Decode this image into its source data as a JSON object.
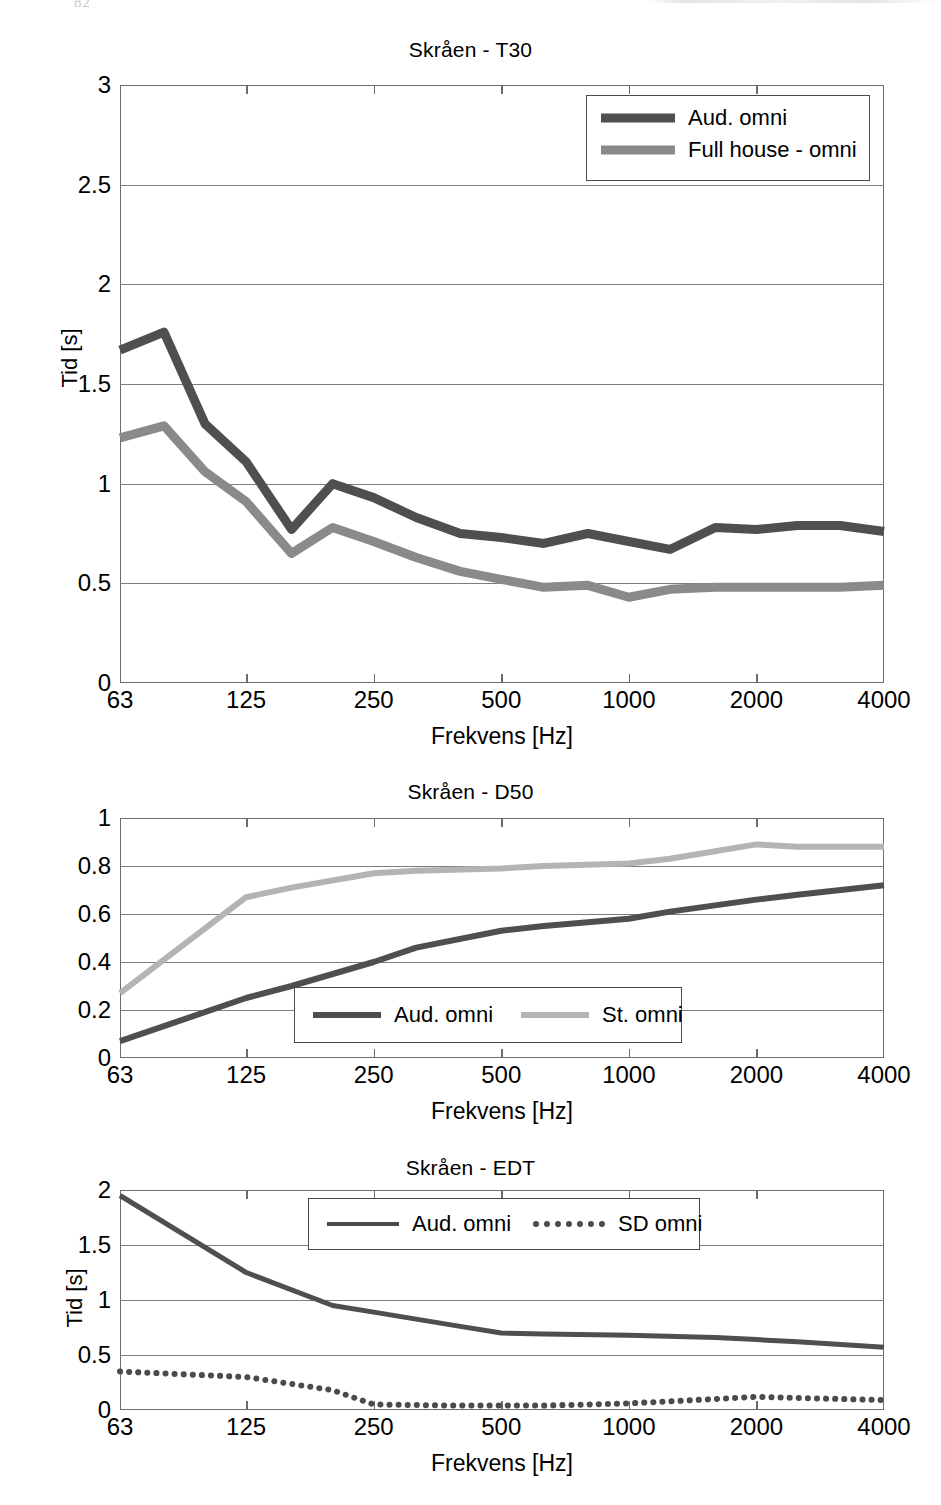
{
  "page": {
    "artifact_number": "82"
  },
  "colors": {
    "dark_series": "#4f4f4f",
    "mid_series": "#8a8a8a",
    "light_series": "#b4b4b4",
    "axis": "#6d6d6d",
    "grid": "#7d7d7d",
    "background": "#ffffff"
  },
  "figures": [
    {
      "id": "t30",
      "title": "Skråen - T30",
      "ylabel": "Tid [s]",
      "xlabel": "Frekvens [Hz]",
      "legend": {
        "position": "top-right",
        "orientation": "vertical",
        "entries": [
          {
            "label": "Aud. omni",
            "color": "#4f4f4f",
            "style": "solid"
          },
          {
            "label": "Full house - omni",
            "color": "#8a8a8a",
            "style": "solid"
          }
        ]
      }
    },
    {
      "id": "d50",
      "title": "Skråen - D50",
      "ylabel": "",
      "xlabel": "Frekvens [Hz]",
      "legend": {
        "position": "bottom-center",
        "orientation": "horizontal",
        "entries": [
          {
            "label": "Aud. omni",
            "color": "#4f4f4f",
            "style": "solid"
          },
          {
            "label": "St. omni",
            "color": "#b4b4b4",
            "style": "solid"
          }
        ]
      }
    },
    {
      "id": "edt",
      "title": "Skråen - EDT",
      "ylabel": "Tid [s]",
      "xlabel": "Frekvens [Hz]",
      "legend": {
        "position": "top-center",
        "orientation": "horizontal",
        "entries": [
          {
            "label": "Aud. omni",
            "color": "#4f4f4f",
            "style": "solid"
          },
          {
            "label": "SD omni",
            "color": "#4b4b4b",
            "style": "dotted"
          }
        ]
      }
    }
  ],
  "chart_data": [
    {
      "type": "line",
      "title": "Skråen - T30",
      "xlabel": "Frekvens [Hz]",
      "ylabel": "Tid [s]",
      "xscale": "log",
      "xlim": [
        63,
        4000
      ],
      "ylim": [
        0,
        3
      ],
      "yticks": [
        0,
        0.5,
        1,
        1.5,
        2,
        2.5,
        3
      ],
      "ytick_labels": [
        "0",
        "0.5",
        "1",
        "1.5",
        "2",
        "2.5",
        "3"
      ],
      "xticks": [
        63,
        125,
        250,
        500,
        1000,
        2000,
        4000
      ],
      "xtick_labels": [
        "63",
        "125",
        "250",
        "500",
        "1000",
        "2000",
        "4000"
      ],
      "grid": true,
      "legend_position": "upper right",
      "x": [
        63,
        80,
        100,
        125,
        160,
        200,
        250,
        315,
        400,
        500,
        630,
        800,
        1000,
        1250,
        1600,
        2000,
        2500,
        3150,
        4000
      ],
      "series": [
        {
          "name": "Aud. omni",
          "color": "#4f4f4f",
          "style": "solid",
          "values": [
            1.67,
            1.76,
            1.3,
            1.11,
            0.77,
            1.0,
            0.93,
            0.83,
            0.75,
            0.73,
            0.7,
            0.75,
            0.71,
            0.67,
            0.78,
            0.77,
            0.79,
            0.79,
            0.76
          ]
        },
        {
          "name": "Full house - omni",
          "color": "#8a8a8a",
          "style": "solid",
          "values": [
            1.23,
            1.29,
            1.06,
            0.91,
            0.65,
            0.78,
            0.71,
            0.63,
            0.56,
            0.52,
            0.48,
            0.49,
            0.43,
            0.47,
            0.48,
            0.48,
            0.48,
            0.48,
            0.49
          ]
        }
      ]
    },
    {
      "type": "line",
      "title": "Skråen - D50",
      "xlabel": "Frekvens [Hz]",
      "ylabel": "",
      "xscale": "log",
      "xlim": [
        63,
        4000
      ],
      "ylim": [
        0,
        1
      ],
      "yticks": [
        0,
        0.2,
        0.4,
        0.6,
        0.8,
        1
      ],
      "ytick_labels": [
        "0",
        "0.2",
        "0.4",
        "0.6",
        "0.8",
        "1"
      ],
      "xticks": [
        63,
        125,
        250,
        500,
        1000,
        2000,
        4000
      ],
      "xtick_labels": [
        "63",
        "125",
        "250",
        "500",
        "1000",
        "2000",
        "4000"
      ],
      "grid": true,
      "legend_position": "lower center",
      "x": [
        63,
        125,
        160,
        250,
        315,
        500,
        630,
        1000,
        1250,
        2000,
        2500,
        4000
      ],
      "series": [
        {
          "name": "Aud. omni",
          "color": "#4f4f4f",
          "style": "solid",
          "values": [
            0.07,
            0.25,
            0.3,
            0.4,
            0.46,
            0.53,
            0.55,
            0.58,
            0.61,
            0.66,
            0.68,
            0.72
          ]
        },
        {
          "name": "St. omni",
          "color": "#b4b4b4",
          "style": "solid",
          "values": [
            0.27,
            0.67,
            0.71,
            0.77,
            0.78,
            0.79,
            0.8,
            0.81,
            0.83,
            0.89,
            0.88,
            0.88
          ]
        }
      ]
    },
    {
      "type": "line",
      "title": "Skråen - EDT",
      "xlabel": "Frekvens [Hz]",
      "ylabel": "Tid [s]",
      "xscale": "log",
      "xlim": [
        63,
        4000
      ],
      "ylim": [
        0,
        2
      ],
      "yticks": [
        0,
        0.5,
        1,
        1.5,
        2
      ],
      "ytick_labels": [
        "0",
        "0.5",
        "1",
        "1.5",
        "2"
      ],
      "xticks": [
        63,
        125,
        250,
        500,
        1000,
        2000,
        4000
      ],
      "xtick_labels": [
        "63",
        "125",
        "250",
        "500",
        "1000",
        "2000",
        "4000"
      ],
      "grid": true,
      "legend_position": "upper center",
      "x": [
        63,
        125,
        200,
        250,
        400,
        500,
        630,
        1000,
        1600,
        2000,
        2500,
        4000
      ],
      "series": [
        {
          "name": "Aud. omni",
          "color": "#4f4f4f",
          "style": "solid",
          "values": [
            1.95,
            1.25,
            0.95,
            0.89,
            0.76,
            0.7,
            0.69,
            0.68,
            0.66,
            0.64,
            0.62,
            0.57
          ]
        },
        {
          "name": "SD omni",
          "color": "#4b4b4b",
          "style": "dotted",
          "values": [
            0.35,
            0.3,
            0.18,
            0.05,
            0.04,
            0.04,
            0.04,
            0.06,
            0.1,
            0.12,
            0.11,
            0.09
          ]
        }
      ]
    }
  ]
}
